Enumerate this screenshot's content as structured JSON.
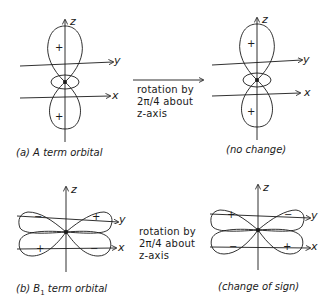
{
  "panel_a": {
    "caption": "(a) A term orbital",
    "result_caption": "(no change)",
    "left_signs": [
      "+",
      "+"
    ],
    "right_signs": [
      "+",
      "+"
    ]
  },
  "panel_b": {
    "caption_prefix": "(b) B",
    "caption_subscript": "1",
    "caption_suffix": " term orbital",
    "result_caption": "(change of sign)",
    "left_signs": {
      "upper_left": "−",
      "upper_right": "+",
      "lower_left": "+",
      "lower_right": "−"
    },
    "right_signs": {
      "upper_left": "+",
      "upper_right": "−",
      "lower_left": "−",
      "lower_right": "+"
    }
  },
  "rotation": {
    "line1": "rotation by",
    "line2": "2π/4 about",
    "line3": "z-axis"
  },
  "axes": {
    "x": "x",
    "y": "y",
    "z": "z"
  },
  "colors": {
    "ink": "#1a1a1a",
    "background": "#ffffff"
  }
}
